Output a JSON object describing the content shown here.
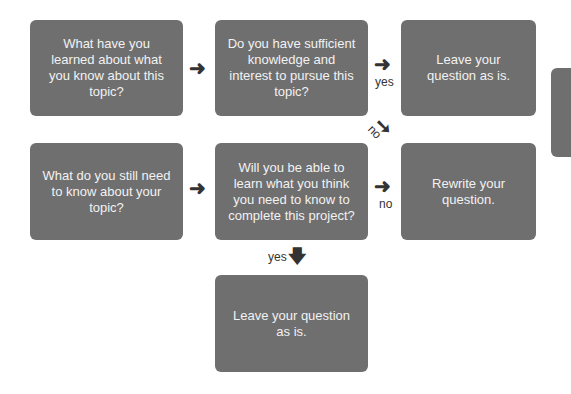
{
  "diagram": {
    "type": "flowchart",
    "colors": {
      "box_fill": "#6f6f6f",
      "box_text": "#f2f2f2",
      "arrow": "#333333",
      "background": "#ffffff"
    },
    "boxes": {
      "learned": "What have you learned about what you know about this topic?",
      "sufficient": "Do you have sufficient knowledge and interest to pursue this topic?",
      "leave_top": "Leave your question as is.",
      "still_need": "What do you still need to know about your topic?",
      "able_to_learn": "Will you be able to learn what you think you need to know to complete this project?",
      "rewrite": "Rewrite your question.",
      "leave_bottom": "Leave your question as is."
    },
    "arrows": {
      "right": "➜",
      "down": "🡇",
      "diag": "➘"
    },
    "labels": {
      "yes_top": "yes",
      "no_diag": "no",
      "no_mid": "no",
      "yes_down": "yes"
    }
  }
}
